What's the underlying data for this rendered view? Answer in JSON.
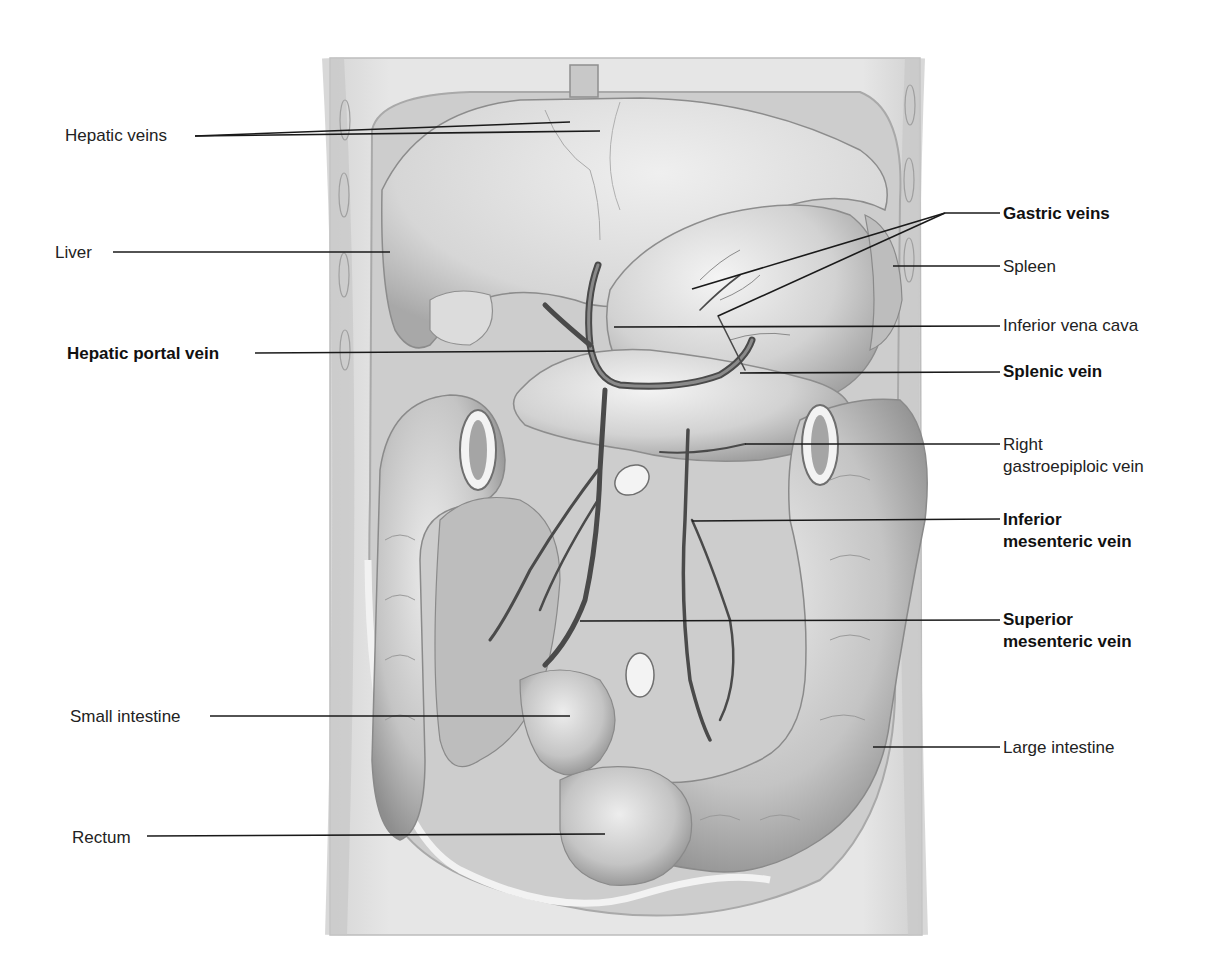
{
  "figure": {
    "colors": {
      "background": "#ffffff",
      "body_wall": "#e4e4e4",
      "cavity": "#cfcfcf",
      "organ_light": "#e9e9e9",
      "organ_mid": "#c9c9c9",
      "organ_dark": "#9a9a9a",
      "vein": "#4a4a4a",
      "leader_line": "#1a1a1a",
      "label_text": "#222222"
    }
  },
  "labels": [
    {
      "id": "hepatic-veins",
      "text": "Hepatic veins",
      "bold": false,
      "side": "left",
      "x": 65,
      "y": 125,
      "lines": [
        [
          195,
          136,
          570,
          122
        ],
        [
          195,
          136,
          600,
          131
        ]
      ]
    },
    {
      "id": "liver",
      "text": "Liver",
      "bold": false,
      "side": "left",
      "x": 55,
      "y": 242,
      "lines": [
        [
          113,
          252,
          390,
          252
        ]
      ]
    },
    {
      "id": "hepatic-portal-vein",
      "text": "Hepatic portal vein",
      "bold": true,
      "side": "left",
      "x": 67,
      "y": 343,
      "lines": [
        [
          255,
          353,
          594,
          351
        ]
      ]
    },
    {
      "id": "small-intestine",
      "text": "Small intestine",
      "bold": false,
      "side": "left",
      "x": 70,
      "y": 706,
      "lines": [
        [
          210,
          716,
          570,
          716
        ]
      ]
    },
    {
      "id": "rectum",
      "text": "Rectum",
      "bold": false,
      "side": "left",
      "x": 72,
      "y": 827,
      "lines": [
        [
          147,
          836,
          605,
          834
        ]
      ]
    },
    {
      "id": "gastric-veins",
      "text": "Gastric veins",
      "bold": true,
      "side": "right",
      "x": 1003,
      "y": 203,
      "lines": [
        [
          1000,
          213,
          945,
          213
        ],
        [
          945,
          213,
          692,
          289
        ],
        [
          945,
          213,
          718,
          316
        ]
      ]
    },
    {
      "id": "spleen",
      "text": "Spleen",
      "bold": false,
      "side": "right",
      "x": 1003,
      "y": 256,
      "lines": [
        [
          1000,
          266,
          893,
          266
        ]
      ]
    },
    {
      "id": "inferior-vena-cava",
      "text": "Inferior vena cava",
      "bold": false,
      "side": "right",
      "x": 1003,
      "y": 315,
      "lines": [
        [
          1000,
          326,
          614,
          327
        ]
      ]
    },
    {
      "id": "splenic-vein",
      "text": "Splenic vein",
      "bold": true,
      "side": "right",
      "x": 1003,
      "y": 361,
      "lines": [
        [
          1000,
          372,
          740,
          373
        ]
      ]
    },
    {
      "id": "right-gastroepiploic-vein",
      "text": "Right",
      "text2": "gastroepiploic vein",
      "bold": false,
      "side": "right",
      "x": 1003,
      "y": 434,
      "lines": [
        [
          1000,
          444,
          745,
          444
        ]
      ]
    },
    {
      "id": "inferior-mesenteric-vein",
      "text": "Inferior",
      "text2": "mesenteric vein",
      "bold": true,
      "side": "right",
      "x": 1003,
      "y": 509,
      "lines": [
        [
          1000,
          519,
          692,
          521
        ]
      ]
    },
    {
      "id": "superior-mesenteric-vein",
      "text": "Superior",
      "text2": "mesenteric vein",
      "bold": true,
      "side": "right",
      "x": 1003,
      "y": 609,
      "lines": [
        [
          1000,
          620,
          580,
          621
        ]
      ]
    },
    {
      "id": "large-intestine",
      "text": "Large intestine",
      "bold": false,
      "side": "right",
      "x": 1003,
      "y": 737,
      "lines": [
        [
          1000,
          747,
          873,
          747
        ]
      ]
    }
  ]
}
